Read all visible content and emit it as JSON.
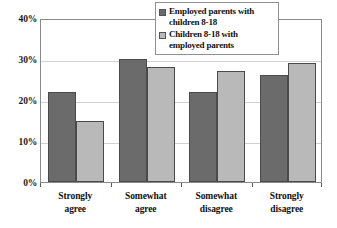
{
  "chart_data": {
    "type": "bar",
    "title": "",
    "subtitle": "",
    "xlabel": "",
    "ylabel": "",
    "ylim": [
      0,
      40
    ],
    "ytick_labels": [
      "0%",
      "10%",
      "20%",
      "30%",
      "40%"
    ],
    "ytick_values": [
      0,
      10,
      20,
      30,
      40
    ],
    "grid": true,
    "legend_position": "top-right-inside",
    "categories": [
      "Strongly agree",
      "Somewhat agree",
      "Somewhat disagree",
      "Strongly disagree"
    ],
    "category_lines": [
      [
        "Strongly",
        "agree"
      ],
      [
        "Somewhat",
        "agree"
      ],
      [
        "Somewhat",
        "disagree"
      ],
      [
        "Strongly",
        "disagree"
      ]
    ],
    "series": [
      {
        "name": "Employed parents with children 8-18",
        "name_lines": [
          "Employed parents with",
          "children 8-18"
        ],
        "color": "#6b6b6b",
        "values": [
          22,
          30,
          22,
          26
        ]
      },
      {
        "name": "Children 8-18 with employed parents",
        "name_lines": [
          "Children 8-18 with",
          "employed parents"
        ],
        "color": "#b9b9b9",
        "values": [
          15,
          28,
          27,
          29
        ]
      }
    ]
  },
  "legend": {
    "items": [
      {
        "label": "Employed parents with\nchildren 8-18",
        "color": "#6b6b6b"
      },
      {
        "label": "Children 8-18 with\nemployed parents",
        "color": "#b9b9b9"
      }
    ]
  },
  "axes": {
    "y": {
      "labels": [
        "40%",
        "30%",
        "20%",
        "10%",
        "0%"
      ]
    },
    "x": {
      "labels": [
        "Strongly agree",
        "Somewhat agree",
        "Somewhat disagree",
        "Strongly disagree"
      ]
    }
  },
  "colors": {
    "series_dark": "#6b6b6b",
    "series_light": "#b9b9b9",
    "axis": "#8a8a8a",
    "gridline": "#d2d2d2",
    "text": "#111111",
    "background": "#ffffff"
  }
}
